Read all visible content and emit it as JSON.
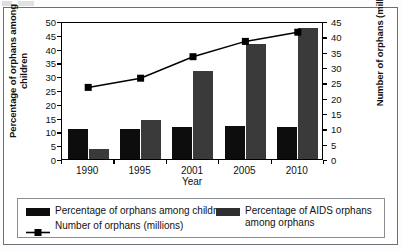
{
  "chart_data": {
    "type": "bar",
    "title": "",
    "subtitle": "",
    "xlabel": "Year",
    "ylabel": "Percentage of orphans among children",
    "y2label": "Number of orphans (millions)",
    "categories": [
      "1990",
      "1995",
      "2001",
      "2005",
      "2010"
    ],
    "ylim": [
      0,
      50
    ],
    "y2lim": [
      0,
      45
    ],
    "yticks": [
      0,
      5,
      10,
      15,
      20,
      25,
      30,
      35,
      40,
      45,
      50
    ],
    "y2ticks": [
      0,
      5,
      10,
      15,
      20,
      25,
      30,
      35,
      40,
      45
    ],
    "grid": false,
    "legend_position": "bottom",
    "series": [
      {
        "name": "Percentage of orphans among children",
        "type": "bar",
        "axis": "left",
        "unit": "%",
        "color": "#0d0d0d",
        "values": [
          11,
          11,
          11.5,
          12,
          11.5
        ]
      },
      {
        "name": "Percentage of AIDS orphans among orphans",
        "type": "bar",
        "axis": "left",
        "unit": "%",
        "color": "#3a3a3a",
        "values": [
          3.5,
          14,
          32,
          41.5,
          47.5
        ]
      },
      {
        "name": "Number of orphans (millions)",
        "type": "line",
        "axis": "right",
        "unit": "millions",
        "color": "#000000",
        "marker": "square",
        "values": [
          24,
          27,
          34,
          39,
          42
        ]
      }
    ]
  },
  "axes": {
    "left": {
      "title": "Percentage of orphans among children",
      "ticks": [
        "50",
        "45",
        "40",
        "35",
        "30",
        "25",
        "20",
        "15",
        "10",
        "5",
        "0"
      ]
    },
    "right": {
      "title": "Number of orphans (millions)",
      "ticks": [
        "45",
        "40",
        "35",
        "30",
        "25",
        "20",
        "15",
        "10",
        "5",
        "0"
      ]
    },
    "bottom": {
      "title": "Year",
      "ticks": [
        "1990",
        "1995",
        "2001",
        "2005",
        "2010"
      ]
    }
  },
  "legend": {
    "entries": [
      {
        "key": "bar-dark",
        "label": "Percentage of orphans among children"
      },
      {
        "key": "line-square",
        "label": "Number of orphans (millions)"
      },
      {
        "key": "bar-gray",
        "label": "Percentage of AIDS orphans among orphans"
      }
    ]
  }
}
